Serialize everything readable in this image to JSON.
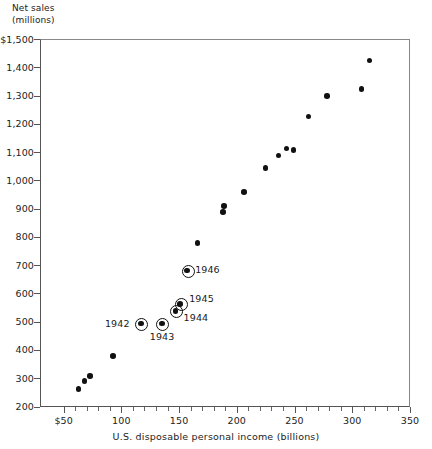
{
  "chart_data": {
    "type": "scatter",
    "title": "",
    "ylabel_line1": "Net sales",
    "ylabel_line2": "(millions)",
    "xlabel": "U.S. disposable personal income (billions)",
    "xlim": [
      30,
      350
    ],
    "ylim": [
      200,
      1500
    ],
    "grid": false,
    "legend": "none",
    "x_ticks": [
      {
        "value": 50,
        "label": "$50"
      },
      {
        "value": 100,
        "label": "100"
      },
      {
        "value": 150,
        "label": "150"
      },
      {
        "value": 200,
        "label": "200"
      },
      {
        "value": 250,
        "label": "250"
      },
      {
        "value": 300,
        "label": "300"
      },
      {
        "value": 350,
        "label": "350"
      }
    ],
    "x_minor_ticks": [
      60,
      70,
      80,
      90,
      110,
      120,
      130,
      140,
      160,
      170,
      180,
      190,
      210,
      220,
      230,
      240,
      260,
      270,
      280,
      290,
      310,
      320,
      330,
      340
    ],
    "y_ticks": [
      {
        "value": 1500,
        "label": "$1,500"
      },
      {
        "value": 1400,
        "label": "1,400"
      },
      {
        "value": 1300,
        "label": "1,300"
      },
      {
        "value": 1200,
        "label": "1,200"
      },
      {
        "value": 1100,
        "label": "1,100"
      },
      {
        "value": 1000,
        "label": "1,000"
      },
      {
        "value": 900,
        "label": "900"
      },
      {
        "value": 800,
        "label": "800"
      },
      {
        "value": 700,
        "label": "700"
      },
      {
        "value": 600,
        "label": "600"
      },
      {
        "value": 500,
        "label": "500"
      },
      {
        "value": 400,
        "label": "400"
      },
      {
        "value": 300,
        "label": "300"
      },
      {
        "value": 200,
        "label": "200"
      }
    ],
    "points": [
      {
        "x": 63,
        "y": 263,
        "label": "",
        "ring": false
      },
      {
        "x": 68,
        "y": 292,
        "label": "",
        "ring": false
      },
      {
        "x": 73,
        "y": 310,
        "label": "",
        "ring": false
      },
      {
        "x": 93,
        "y": 380,
        "label": "",
        "ring": false
      },
      {
        "x": 117,
        "y": 495,
        "label": "1942",
        "ring": true,
        "label_pos": "left"
      },
      {
        "x": 135,
        "y": 495,
        "label": "1943",
        "ring": true,
        "label_pos": "below"
      },
      {
        "x": 147,
        "y": 540,
        "label": "1944",
        "ring": true,
        "label_pos": "right-below"
      },
      {
        "x": 151,
        "y": 565,
        "label": "1945",
        "ring": true,
        "label_pos": "right-above"
      },
      {
        "x": 157,
        "y": 683,
        "label": "1946",
        "ring": true,
        "label_pos": "right"
      },
      {
        "x": 166,
        "y": 780,
        "label": "",
        "ring": false
      },
      {
        "x": 188,
        "y": 890,
        "label": "",
        "ring": false
      },
      {
        "x": 189,
        "y": 910,
        "label": "",
        "ring": false
      },
      {
        "x": 206,
        "y": 960,
        "label": "",
        "ring": false
      },
      {
        "x": 225,
        "y": 1045,
        "label": "",
        "ring": false
      },
      {
        "x": 236,
        "y": 1090,
        "label": "",
        "ring": false
      },
      {
        "x": 243,
        "y": 1115,
        "label": "",
        "ring": false
      },
      {
        "x": 249,
        "y": 1110,
        "label": "",
        "ring": false
      },
      {
        "x": 262,
        "y": 1228,
        "label": "",
        "ring": false
      },
      {
        "x": 278,
        "y": 1300,
        "label": "",
        "ring": false
      },
      {
        "x": 308,
        "y": 1325,
        "label": "",
        "ring": false
      },
      {
        "x": 315,
        "y": 1425,
        "label": "",
        "ring": false
      }
    ]
  }
}
